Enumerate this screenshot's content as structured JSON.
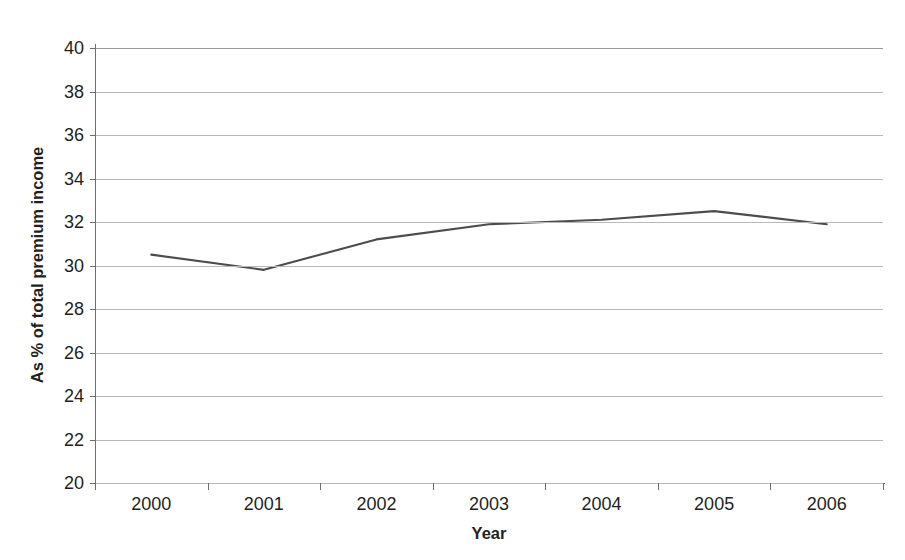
{
  "chart_data": {
    "type": "line",
    "title": "",
    "xlabel": "Year",
    "ylabel": "As % of total premium income",
    "categories": [
      "2000",
      "2001",
      "2002",
      "2003",
      "2004",
      "2005",
      "2006"
    ],
    "values": [
      30.5,
      29.8,
      31.2,
      31.9,
      32.1,
      32.5,
      31.9
    ],
    "series": [
      {
        "name": "As % of total premium income",
        "values": [
          30.5,
          29.8,
          31.2,
          31.9,
          32.1,
          32.5,
          31.9
        ]
      }
    ],
    "ylim": [
      20,
      40
    ],
    "y_ticks": [
      40,
      38,
      36,
      34,
      32,
      30,
      28,
      26,
      24,
      22,
      20
    ],
    "y_tick_labels": [
      "40",
      "38",
      "36",
      "34",
      "32",
      "30",
      "28",
      "26",
      "24",
      "22",
      "20"
    ],
    "grid": true,
    "grid_axis": "y",
    "legend": false,
    "legend_position": "none",
    "line_color": "#4c4c4c",
    "grid_color": "#b8b8b8",
    "axis_color": "#6f6f6f",
    "text_color": "#231f20",
    "background_color": "#ffffff",
    "markers": false
  }
}
